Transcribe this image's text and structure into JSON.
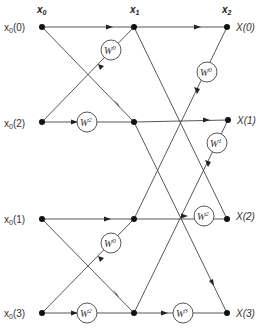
{
  "diagram": {
    "type": "FFT butterfly flow graph (4-point, decimation-in-time)",
    "stage_headers": [
      {
        "main": "x",
        "sub": "0"
      },
      {
        "main": "x",
        "sub": "1"
      },
      {
        "main": "x",
        "sub": "2"
      }
    ],
    "inputs": [
      {
        "text": "x",
        "sub": "0",
        "arg": "(0)"
      },
      {
        "text": "x",
        "sub": "0",
        "arg": "(2)"
      },
      {
        "text": "x",
        "sub": "0",
        "arg": "(1)"
      },
      {
        "text": "x",
        "sub": "0",
        "arg": "(3)"
      }
    ],
    "outputs": [
      "X(0)",
      "X(1)",
      "X(2)",
      "X(3)"
    ],
    "twiddles": [
      {
        "id": "w-a",
        "base": "W",
        "exp": "0"
      },
      {
        "id": "w-b",
        "base": "W",
        "exp": "2"
      },
      {
        "id": "w-c",
        "base": "W",
        "exp": "0"
      },
      {
        "id": "w-d",
        "base": "W",
        "exp": "2"
      },
      {
        "id": "w-e",
        "base": "W",
        "exp": "0"
      },
      {
        "id": "w-f",
        "base": "W",
        "exp": "1"
      },
      {
        "id": "w-g",
        "base": "W",
        "exp": "2"
      },
      {
        "id": "w-h",
        "base": "W",
        "exp": "3"
      }
    ]
  }
}
